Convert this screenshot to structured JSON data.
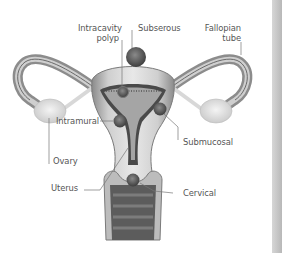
{
  "figure": {
    "labels": {
      "intracavity_line1": "Intracavity",
      "intracavity_line2": "polyp",
      "subserous": "Subserous",
      "fallopian_line1": "Fallopian",
      "fallopian_line2": "tube",
      "intramural": "Intramural",
      "submucosal": "Submucosal",
      "ovary": "Ovary",
      "uterus": "Uterus",
      "cervical": "Cervical"
    },
    "colors": {
      "tissue_light": "#e4e4e4",
      "tissue_mid": "#9a9a9a",
      "tissue_dark": "#4a4a4a",
      "fibroid": "#5a5a5a",
      "label_text": "#555555",
      "leader_line": "#777777",
      "side_bar": "#c4c4c4"
    }
  }
}
